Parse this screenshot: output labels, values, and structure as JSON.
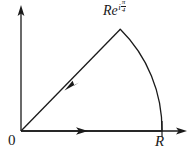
{
  "figure": {
    "kind": "complex-plane-contour-diagram",
    "background_color": "#ffffff",
    "stroke_color": "#1a1a1a",
    "labels": {
      "origin": "0",
      "radius_endpoint": "R",
      "apex_base": "Re",
      "apex_exponent_i": "i",
      "apex_exponent_numerator": "π",
      "apex_exponent_denominator": "4",
      "apex_full": "Re^{iπ/4}"
    },
    "axes": {
      "origin_point": [
        21,
        131
      ],
      "x_axis_end": [
        187,
        131
      ],
      "y_axis_top": [
        21,
        8
      ],
      "x_arrow": "right",
      "y_arrow": "up"
    },
    "contour": {
      "segments": [
        {
          "name": "real-axis-segment",
          "type": "line",
          "from": [
            21,
            131
          ],
          "to": [
            162,
            131
          ],
          "direction_arrow": "right",
          "arrow_at": [
            80,
            131
          ]
        },
        {
          "name": "circular-arc",
          "type": "arc",
          "from": [
            162,
            131
          ],
          "to": [
            121,
            29
          ],
          "radius": 141,
          "sweep_angle_deg": 45,
          "direction": "counterclockwise"
        },
        {
          "name": "diagonal-return",
          "type": "line",
          "from": [
            121,
            29
          ],
          "to": [
            21,
            131
          ],
          "direction_arrow": "toward-origin",
          "arrow_at": [
            73,
            82
          ],
          "angle_deg": 45
        }
      ],
      "tick_at_R": {
        "x": 162,
        "y_top": 120,
        "y_bottom": 138
      }
    }
  }
}
